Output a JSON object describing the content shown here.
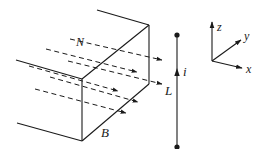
{
  "diagram": {
    "type": "physics-figure",
    "colors": {
      "ink": "#1a1a1a",
      "background": "#ffffff"
    },
    "box": {
      "label": "B",
      "field_symbol": "N",
      "field_lines_count": 6
    },
    "wire": {
      "length_label": "L",
      "current_label": "i",
      "endpoints": "dots"
    },
    "axes": {
      "x_label": "x",
      "y_label": "y",
      "z_label": "z"
    }
  }
}
